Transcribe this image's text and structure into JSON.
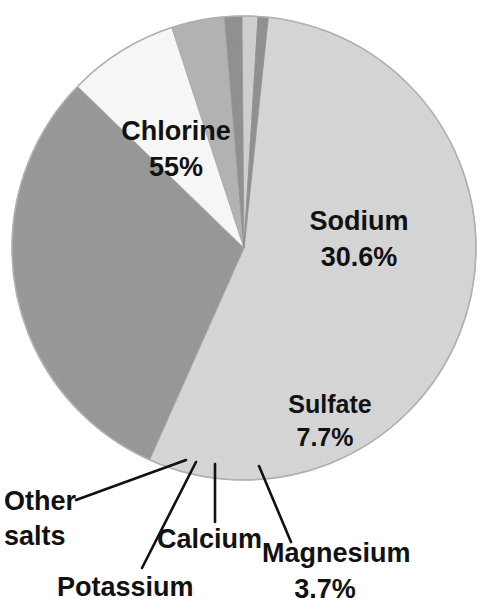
{
  "figure": {
    "background_color": "#ffffff",
    "text_color": "#111111",
    "pie": {
      "center_x": 244,
      "center_y": 248,
      "radius": 232,
      "start_angle_deg": -84,
      "direction": "clockwise",
      "rim_color": "#a8a8a8"
    }
  },
  "chart_data": {
    "type": "pie",
    "title": "",
    "subtitle": "",
    "xlabel": "",
    "ylabel": "",
    "grid": false,
    "legend_position": "none",
    "label_style": "inside-and-callout",
    "units": "percent",
    "total": 100,
    "categories": [
      "Chlorine",
      "Sodium",
      "Sulfate",
      "Magnesium",
      "Calcium",
      "Potassium",
      "Other salts"
    ],
    "values": [
      55,
      30.6,
      7.7,
      3.7,
      1.2,
      1.1,
      0.7
    ],
    "value_labels": [
      "55%",
      "30.6%",
      "7.7%",
      "3.7%",
      "",
      "",
      ""
    ],
    "colors": [
      "#d5d5d5",
      "#969696",
      "#f8f8f8",
      "#b2b2b2",
      "#8e8e8e",
      "#cfcfcf",
      "#8e8e8e"
    ],
    "slices": [
      {
        "name": "Chlorine",
        "value": 55,
        "value_label": "55%",
        "color": "#d5d5d5",
        "label_placement": "inside",
        "label_x": 176,
        "label_y": 140,
        "value_x": 176,
        "value_y": 176
      },
      {
        "name": "Sodium",
        "value": 30.6,
        "value_label": "30.6%",
        "color": "#969696",
        "label_placement": "inside",
        "label_x": 359,
        "label_y": 230,
        "value_x": 359,
        "value_y": 266
      },
      {
        "name": "Sulfate",
        "value": 7.7,
        "value_label": "7.7%",
        "color": "#f8f8f8",
        "label_placement": "inside",
        "label_x": 328,
        "label_y": 413,
        "value_x": 323,
        "value_y": 447
      },
      {
        "name": "Magnesium",
        "value": 3.7,
        "value_label": "3.7%",
        "color": "#b2b2b2",
        "label_placement": "callout",
        "label_x": 265,
        "label_y": 562,
        "value_x": 325,
        "value_y": 598,
        "leader": {
          "x1": 259,
          "y1": 466,
          "x2": 291,
          "y2": 542
        }
      },
      {
        "name": "Calcium",
        "value": 1.2,
        "value_label": "",
        "color": "#8e8e8e",
        "label_placement": "callout",
        "label_x": 157,
        "label_y": 546,
        "value_x": 0,
        "value_y": 0,
        "leader": {
          "x1": 215,
          "y1": 464,
          "x2": 215,
          "y2": 522
        }
      },
      {
        "name": "Potassium",
        "value": 1.1,
        "value_label": "",
        "color": "#cfcfcf",
        "label_placement": "callout",
        "label_x": 57,
        "label_y": 593,
        "value_x": 0,
        "value_y": 0,
        "leader": {
          "x1": 196,
          "y1": 462,
          "x2": 142,
          "y2": 568
        }
      },
      {
        "name": "Other salts",
        "value": 0.7,
        "value_label": "",
        "color": "#8e8e8e",
        "label_placement": "callout",
        "label_x": 4,
        "label_y": 510,
        "label_x2": 4,
        "label_y2": 545,
        "leader": {
          "x1": 186,
          "y1": 460,
          "x2": 76,
          "y2": 500
        }
      }
    ],
    "annotations": [
      {
        "text": "Chlorine",
        "kind": "slice-name"
      },
      {
        "text": "55%",
        "kind": "slice-value"
      },
      {
        "text": "Sodium",
        "kind": "slice-name"
      },
      {
        "text": "30.6%",
        "kind": "slice-value"
      },
      {
        "text": "Sulfate",
        "kind": "slice-name"
      },
      {
        "text": "7.7%",
        "kind": "slice-value"
      },
      {
        "text": "Magnesium",
        "kind": "slice-name"
      },
      {
        "text": "3.7%",
        "kind": "slice-value"
      },
      {
        "text": "Calcium",
        "kind": "slice-name"
      },
      {
        "text": "Potassium",
        "kind": "slice-name"
      },
      {
        "text": "Other",
        "kind": "slice-name"
      },
      {
        "text": "salts",
        "kind": "slice-name"
      }
    ]
  },
  "labels": {
    "chlorine_name": "Chlorine",
    "chlorine_value": "55%",
    "sodium_name": "Sodium",
    "sodium_value": "30.6%",
    "sulfate_name": "Sulfate",
    "sulfate_value": "7.7%",
    "magnesium_name": "Magnesium",
    "magnesium_value": "3.7%",
    "calcium_name": "Calcium",
    "potassium_name": "Potassium",
    "other_name_line1": "Other",
    "other_name_line2": "salts"
  }
}
